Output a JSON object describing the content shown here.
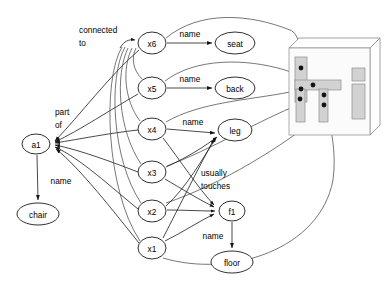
{
  "diagram": {
    "type": "node-link-diagram",
    "colors": {
      "node_fill": "#ffffff",
      "node_stroke": "#1a1a1a",
      "edge": "#4a4a4a",
      "part_fill": "#d2d2d2",
      "joint": "#141414",
      "background": "#ffffff"
    },
    "nodes": [
      {
        "id": "a1",
        "label": "a1",
        "x": 36,
        "y": 144,
        "rx": 14,
        "ry": 10,
        "kind": "instance"
      },
      {
        "id": "chair",
        "label": "chair",
        "x": 38,
        "y": 214,
        "rx": 21,
        "ry": 11,
        "kind": "concept"
      },
      {
        "id": "x6",
        "label": "x6",
        "x": 152,
        "y": 43,
        "rx": 14,
        "ry": 11,
        "kind": "instance"
      },
      {
        "id": "x5",
        "label": "x5",
        "x": 152,
        "y": 88,
        "rx": 14,
        "ry": 11,
        "kind": "instance"
      },
      {
        "id": "x4",
        "label": "x4",
        "x": 152,
        "y": 129,
        "rx": 14,
        "ry": 11,
        "kind": "instance"
      },
      {
        "id": "x3",
        "label": "x3",
        "x": 152,
        "y": 172,
        "rx": 14,
        "ry": 11,
        "kind": "instance"
      },
      {
        "id": "x2",
        "label": "x2",
        "x": 152,
        "y": 211,
        "rx": 14,
        "ry": 11,
        "kind": "instance"
      },
      {
        "id": "x1",
        "label": "x1",
        "x": 152,
        "y": 248,
        "rx": 14,
        "ry": 11,
        "kind": "instance"
      },
      {
        "id": "seat",
        "label": "seat",
        "x": 235,
        "y": 43,
        "rx": 20,
        "ry": 11,
        "kind": "concept"
      },
      {
        "id": "back",
        "label": "back",
        "x": 235,
        "y": 88,
        "rx": 20,
        "ry": 11,
        "kind": "concept"
      },
      {
        "id": "leg",
        "label": "leg",
        "x": 235,
        "y": 130,
        "rx": 17,
        "ry": 11,
        "kind": "concept"
      },
      {
        "id": "f1",
        "label": "f1",
        "x": 232,
        "y": 211,
        "rx": 13,
        "ry": 10,
        "kind": "instance"
      },
      {
        "id": "floor",
        "label": "floor",
        "x": 232,
        "y": 262,
        "rx": 21,
        "ry": 11,
        "kind": "concept"
      }
    ],
    "edge_labels": {
      "connected_to": "connected\nto",
      "connected_to_line1": "connected",
      "connected_to_line2": "to",
      "part_of_line1": "part",
      "part_of_line2": "of",
      "usually_touches_line1": "usually",
      "usually_touches_line2": "touches",
      "name_seat": "name",
      "name_back": "name",
      "name_leg": "name",
      "name_chair": "name",
      "name_floor": "name"
    },
    "edges": [
      {
        "from": "a1",
        "to": "chair",
        "label": "name",
        "kind": "name"
      },
      {
        "from": "x6",
        "to": "seat",
        "label": "name",
        "kind": "name"
      },
      {
        "from": "x5",
        "to": "back",
        "label": "name",
        "kind": "name"
      },
      {
        "from": "x4",
        "to": "leg",
        "label": "name",
        "kind": "name"
      },
      {
        "from": "f1",
        "to": "floor",
        "label": "name",
        "kind": "name"
      },
      {
        "from": "x6",
        "to": "a1",
        "label": "part of",
        "kind": "part-of"
      },
      {
        "from": "x5",
        "to": "a1",
        "label": "part of",
        "kind": "part-of"
      },
      {
        "from": "x4",
        "to": "a1",
        "label": "part of",
        "kind": "part-of"
      },
      {
        "from": "x3",
        "to": "a1",
        "label": "part of",
        "kind": "part-of"
      },
      {
        "from": "x2",
        "to": "a1",
        "label": "part of",
        "kind": "part-of"
      },
      {
        "from": "x1",
        "to": "a1",
        "label": "part of",
        "kind": "part-of"
      },
      {
        "from": "x5",
        "to": "x6",
        "label": "connected to",
        "kind": "connected-to"
      },
      {
        "from": "x4",
        "to": "x6",
        "label": "connected to",
        "kind": "connected-to"
      },
      {
        "from": "x3",
        "to": "x6",
        "label": "connected to",
        "kind": "connected-to"
      },
      {
        "from": "x2",
        "to": "x6",
        "label": "connected to",
        "kind": "connected-to"
      },
      {
        "from": "x1",
        "to": "x6",
        "label": "connected to",
        "kind": "connected-to"
      },
      {
        "from": "x3",
        "to": "leg",
        "label": "name",
        "kind": "name"
      },
      {
        "from": "x2",
        "to": "leg",
        "label": "name",
        "kind": "name"
      },
      {
        "from": "x1",
        "to": "leg",
        "label": "name",
        "kind": "name"
      },
      {
        "from": "x4",
        "to": "f1",
        "label": "usually touches",
        "kind": "usually-touches"
      },
      {
        "from": "x3",
        "to": "f1",
        "label": "usually touches",
        "kind": "usually-touches"
      },
      {
        "from": "x2",
        "to": "f1",
        "label": "usually touches",
        "kind": "usually-touches"
      },
      {
        "from": "x1",
        "to": "f1",
        "label": "usually touches",
        "kind": "usually-touches"
      }
    ],
    "grounding_curves": {
      "count": 6,
      "description": "long curves from x-nodes to chair picture joints"
    }
  },
  "picture": {
    "name": "chair-illustration",
    "parts": [
      {
        "name": "chair-back-bar",
        "x": 295,
        "y": 57,
        "w": 12,
        "h": 45
      },
      {
        "name": "chair-seat-bar",
        "x": 295,
        "y": 80,
        "w": 46,
        "h": 10
      },
      {
        "name": "chair-leg-front",
        "x": 319,
        "y": 89,
        "w": 9,
        "h": 33
      },
      {
        "name": "chair-leg-back",
        "x": 296,
        "y": 89,
        "w": 9,
        "h": 33
      },
      {
        "name": "side-square",
        "x": 352,
        "y": 68,
        "w": 13,
        "h": 13
      },
      {
        "name": "side-rect",
        "x": 352,
        "y": 84,
        "w": 13,
        "h": 35
      }
    ],
    "joints": [
      {
        "name": "joint-back-top",
        "x": 301,
        "y": 68
      },
      {
        "name": "joint-seat-mid",
        "x": 313,
        "y": 85
      },
      {
        "name": "joint-back-lower",
        "x": 301,
        "y": 89
      },
      {
        "name": "joint-leg-back",
        "x": 300,
        "y": 99
      },
      {
        "name": "joint-leg-front",
        "x": 324,
        "y": 94
      },
      {
        "name": "joint-leg-front2",
        "x": 324,
        "y": 104
      }
    ]
  }
}
